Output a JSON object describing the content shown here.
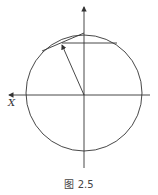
{
  "diagram": {
    "axis_label_x": "X",
    "caption": "图 2.5",
    "stroke_color": "#333333"
  }
}
